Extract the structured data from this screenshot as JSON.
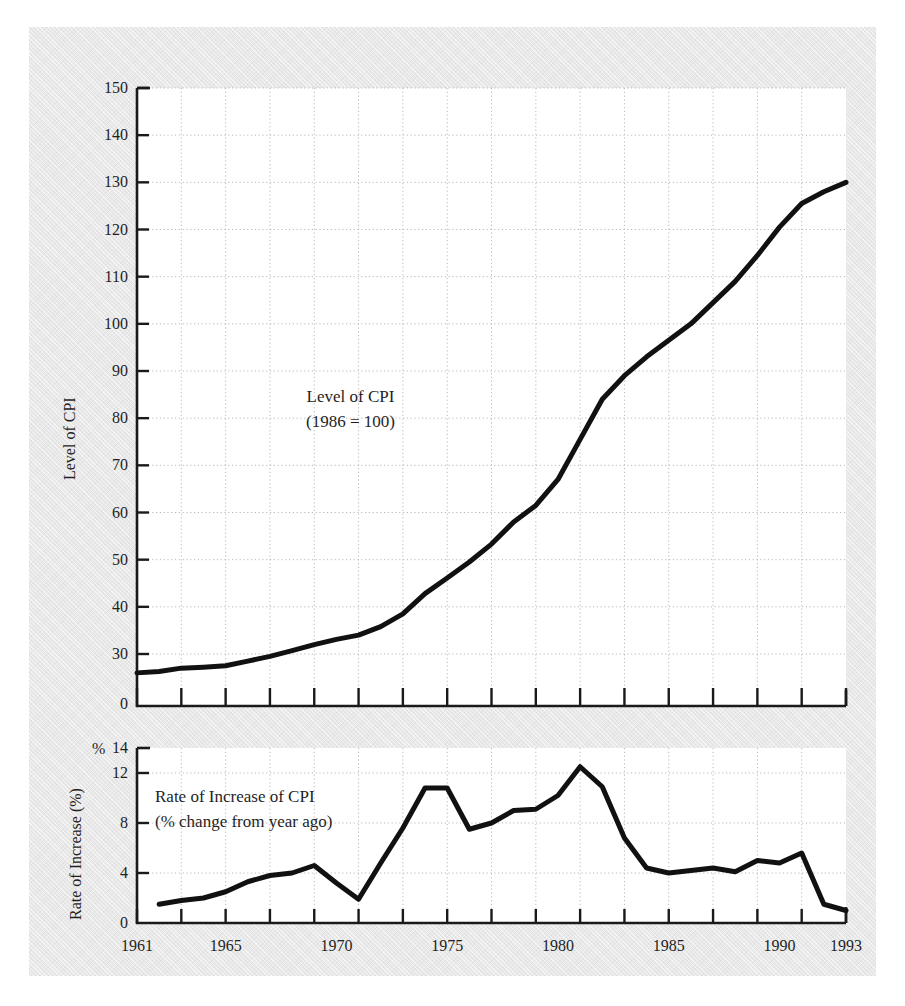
{
  "page": {
    "background_color": "#e8e8e8",
    "plot_background_color": "#ffffff",
    "line_color": "#111111",
    "grid_color": "#b9b9b9",
    "axis_color": "#1a1a1a",
    "top_caption": ""
  },
  "chart_data": [
    {
      "type": "line",
      "id": "level-of-cpi",
      "title": "",
      "annotation_line1": "Level of CPI",
      "annotation_line2": "(1986 = 100)",
      "xlabel": "",
      "ylabel": "Level of CPI",
      "xlim": [
        1961,
        1993
      ],
      "ylim": [
        24,
        150
      ],
      "yticks": [
        30,
        40,
        50,
        60,
        70,
        80,
        90,
        100,
        110,
        120,
        130,
        140,
        150
      ],
      "ytick_labels": [
        "30",
        "40",
        "50",
        "60",
        "70",
        "80",
        "90",
        "100",
        "110",
        "120",
        "130",
        "140",
        "150"
      ],
      "y_axis_origin_label": "0",
      "y_axis_broken": true,
      "xticks": [
        1961,
        1963,
        1965,
        1967,
        1969,
        1971,
        1973,
        1975,
        1977,
        1979,
        1981,
        1983,
        1985,
        1987,
        1989,
        1991,
        1993
      ],
      "xtick_labels": [
        "1961",
        "1965",
        "1970",
        "1975",
        "1980",
        "1985",
        "1990",
        "1993"
      ],
      "xtick_label_years": [
        1961,
        1965,
        1970,
        1975,
        1980,
        1985,
        1990,
        1993
      ],
      "grid": true,
      "x": [
        1961,
        1962,
        1963,
        1964,
        1965,
        1966,
        1967,
        1968,
        1969,
        1970,
        1971,
        1972,
        1973,
        1974,
        1975,
        1976,
        1977,
        1978,
        1979,
        1980,
        1981,
        1982,
        1983,
        1984,
        1985,
        1986,
        1987,
        1988,
        1989,
        1990,
        1991,
        1992,
        1993
      ],
      "values": [
        26.0,
        26.3,
        27.0,
        27.2,
        27.5,
        28.5,
        29.5,
        30.7,
        32.0,
        33.1,
        34.0,
        35.8,
        38.5,
        42.8,
        46.1,
        49.5,
        53.3,
        58.0,
        61.5,
        67.0,
        75.5,
        84.0,
        89.0,
        93.0,
        96.5,
        100.0,
        104.5,
        109.0,
        114.5,
        120.5,
        125.5,
        128.0,
        130.0
      ]
    },
    {
      "type": "line",
      "id": "rate-of-increase-of-cpi",
      "title": "",
      "annotation_line1": "Rate of Increase  of CPI",
      "annotation_line2": "(% change from year ago)",
      "xlabel": "",
      "ylabel": "Rate of Increase (%)",
      "y_unit_marker": "%",
      "xlim": [
        1961,
        1993
      ],
      "ylim": [
        0,
        14
      ],
      "yticks": [
        0,
        4,
        8,
        12
      ],
      "ytick_labels": [
        "0",
        "4",
        "8",
        "12"
      ],
      "y_axis_top_label": "14",
      "xticks": [
        1961,
        1963,
        1965,
        1967,
        1969,
        1971,
        1973,
        1975,
        1977,
        1979,
        1981,
        1983,
        1985,
        1987,
        1989,
        1991,
        1993
      ],
      "grid": true,
      "x": [
        1962,
        1963,
        1964,
        1965,
        1966,
        1967,
        1968,
        1969,
        1970,
        1971,
        1972,
        1973,
        1974,
        1975,
        1976,
        1977,
        1978,
        1979,
        1980,
        1981,
        1982,
        1983,
        1984,
        1985,
        1986,
        1987,
        1988,
        1989,
        1990,
        1991,
        1992,
        1993
      ],
      "values": [
        1.5,
        1.8,
        2.0,
        2.5,
        3.3,
        3.8,
        4.0,
        4.6,
        3.2,
        1.9,
        4.8,
        7.6,
        10.8,
        10.8,
        7.5,
        8.0,
        9.0,
        9.1,
        10.2,
        12.5,
        10.9,
        6.8,
        4.4,
        4.0,
        4.2,
        4.4,
        4.1,
        5.0,
        4.8,
        5.6,
        1.5,
        1.0
      ]
    }
  ],
  "axes": {
    "upper": {
      "ylabel": "Level of CPI",
      "tick_labels": [
        "150",
        "140",
        "130",
        "120",
        "110",
        "100",
        "90",
        "80",
        "70",
        "60",
        "50",
        "40",
        "30",
        "0"
      ]
    },
    "lower": {
      "ylabel": "Rate of Increase (%)",
      "percent_symbol": "%",
      "tick_labels": [
        "14",
        "12",
        "8",
        "4",
        "0"
      ]
    },
    "xaxis": {
      "labels": [
        "1961",
        "1965",
        "1970",
        "1975",
        "1980",
        "1985",
        "1990",
        "1993"
      ]
    }
  }
}
